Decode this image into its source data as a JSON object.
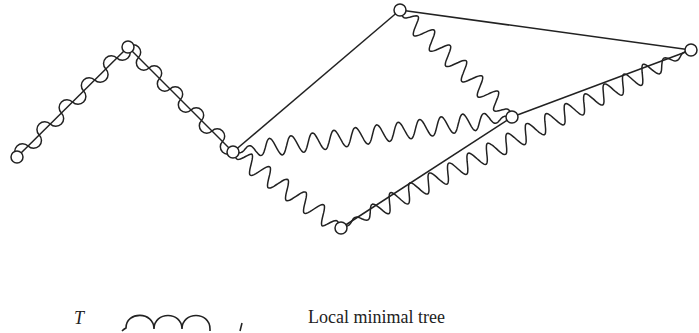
{
  "diagram": {
    "stroke_color": "#222222",
    "background": "#ffffff",
    "nodes": [
      {
        "id": "A",
        "x": 17,
        "y": 157
      },
      {
        "id": "B",
        "x": 128,
        "y": 47
      },
      {
        "id": "C",
        "x": 233,
        "y": 152
      },
      {
        "id": "D",
        "x": 400,
        "y": 10
      },
      {
        "id": "E",
        "x": 691,
        "y": 50
      },
      {
        "id": "F",
        "x": 512,
        "y": 117
      },
      {
        "id": "G",
        "x": 341,
        "y": 228
      }
    ],
    "straight_edges": [
      [
        "C",
        "D"
      ],
      [
        "D",
        "E"
      ],
      [
        "E",
        "F"
      ],
      [
        "F",
        "G"
      ]
    ],
    "wavy_edges": [
      [
        "D",
        "F"
      ],
      [
        "C",
        "F"
      ],
      [
        "C",
        "G"
      ],
      [
        "G",
        "E"
      ]
    ],
    "loopy_edges": [
      [
        "A",
        "B"
      ],
      [
        "B",
        "C"
      ]
    ]
  },
  "legend": {
    "symbol_label": "T",
    "text": "Local minimal tree"
  }
}
